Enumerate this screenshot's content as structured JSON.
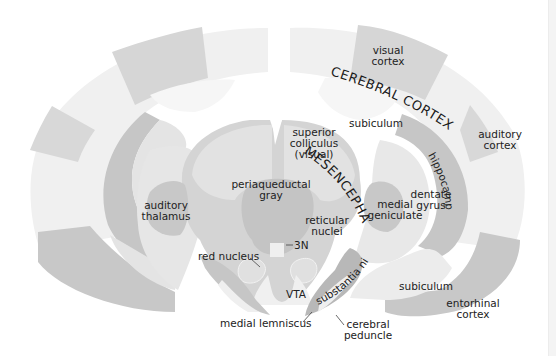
{
  "diagram": {
    "colors": {
      "background": "#ffffff",
      "lightest": "#f3f3f3",
      "light": "#e6e6e6",
      "mid": "#d6d6d6",
      "dark": "#c2c2c2",
      "darker": "#b4b4b4",
      "text": "#222222"
    },
    "region_labels": {
      "cerebral_cortex": "CEREBRAL CORTEX",
      "mesencephalon": "MESENCEPHALON"
    },
    "labels": {
      "visual_cortex_1": "visual",
      "visual_cortex_2": "cortex",
      "auditory_cortex_1": "auditory",
      "auditory_cortex_2": "cortex",
      "subiculum_top": "subiculum",
      "superior_colliculus_1": "superior",
      "superior_colliculus_2": "colliculus",
      "superior_colliculus_3": "(visual)",
      "hippocampus": "hippocampus",
      "periaqueductal_gray_1": "periaqueductal",
      "periaqueductal_gray_2": "gray",
      "auditory_thalamus_1": "auditory",
      "auditory_thalamus_2": "thalamus",
      "medial_geniculate_1": "medial",
      "medial_geniculate_2": "geniculate",
      "dentate_gyrus_1": "dentate",
      "dentate_gyrus_2": "gyrus",
      "reticular_nuclei_1": "reticular",
      "reticular_nuclei_2": "nuclei",
      "3n": "3N",
      "red_nucleus": "red nucleus",
      "vta": "VTA",
      "substantia_nigra": "substantia nigra",
      "subiculum_bottom": "subiculum",
      "entorhinal_cortex_1": "entorhinal",
      "entorhinal_cortex_2": "cortex",
      "medial_lemniscus": "medial lemniscus",
      "cerebral_peduncle_1": "cerebral",
      "cerebral_peduncle_2": "peduncle"
    }
  }
}
